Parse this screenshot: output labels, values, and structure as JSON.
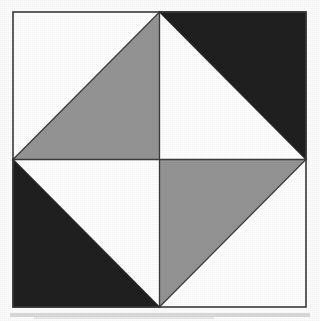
{
  "figure": {
    "title": "Pinwheel quilt block",
    "canvas": {
      "width": 320,
      "height": 321
    },
    "background_color": "#fdfdfd",
    "square": {
      "left": 13,
      "top": 12,
      "right": 306,
      "bottom": 307,
      "center_x": 159.5,
      "center_y": 159.5,
      "border_color": "#3a3a3a",
      "border_width": 1.6,
      "fill_color": "#ffffff"
    },
    "colors": {
      "gray": "#949494",
      "black": "#1f1f1f",
      "white": "#ffffff",
      "outline": "#3a3a3a",
      "paper": "#fdfdfd",
      "smudge": "#8d8d8d"
    },
    "quadrants": [
      {
        "name": "top-left",
        "fill": "gray",
        "fill_color": "#949494",
        "triangle_half": "lower-right",
        "points": "13,159.5 159.5,12 159.5,159.5",
        "white_half_points": "13,12 159.5,12 13,159.5"
      },
      {
        "name": "top-right",
        "fill": "black",
        "fill_color": "#1f1f1f",
        "triangle_half": "upper-right",
        "points": "159.5,12 306,12 306,159.5",
        "white_half_points": "159.5,12 306,159.5 159.5,159.5"
      },
      {
        "name": "bottom-left",
        "fill": "black",
        "fill_color": "#1f1f1f",
        "triangle_half": "lower-left",
        "points": "13,159.5 159.5,307 13,307",
        "white_half_points": "13,159.5 159.5,159.5 159.5,307"
      },
      {
        "name": "bottom-right",
        "fill": "gray",
        "fill_color": "#949494",
        "triangle_half": "upper-left",
        "points": "159.5,159.5 306,159.5 159.5,307",
        "white_half_points": "306,159.5 306,307 159.5,307"
      }
    ],
    "internal_lines": [
      {
        "name": "vertical-midline",
        "x1": 159.5,
        "y1": 12,
        "x2": 159.5,
        "y2": 307
      },
      {
        "name": "horizontal-midline",
        "x1": 13,
        "y1": 159.5,
        "x2": 306,
        "y2": 159.5
      }
    ],
    "diagonal_edges": [
      {
        "name": "top-left-diagonal",
        "x1": 13,
        "y1": 159.5,
        "x2": 159.5,
        "y2": 12
      },
      {
        "name": "top-right-diagonal",
        "x1": 159.5,
        "y1": 12,
        "x2": 306,
        "y2": 159.5
      },
      {
        "name": "bottom-left-diagonal",
        "x1": 13,
        "y1": 159.5,
        "x2": 159.5,
        "y2": 307
      },
      {
        "name": "bottom-right-diagonal",
        "x1": 159.5,
        "y1": 307,
        "x2": 306,
        "y2": 159.5
      }
    ],
    "scan_artifact": {
      "name": "bottom-scan-smudge",
      "top": 313,
      "height": 4,
      "color": "#9a9a9a",
      "opacity": 0.35
    }
  }
}
